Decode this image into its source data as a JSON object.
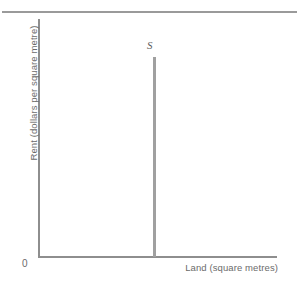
{
  "chart_data": {
    "type": "line",
    "title": "",
    "subtitle": "",
    "xlabel": "Land (square metres)",
    "ylabel": "Rent (dollars per square metre)",
    "origin_label": "0",
    "grid": false,
    "legend": "none",
    "axis_ranges": {
      "x": [
        0,
        1
      ],
      "y": [
        0,
        1
      ]
    },
    "axis_ticks": {
      "x": [],
      "y": []
    },
    "series": [
      {
        "name": "S",
        "description": "Perfectly inelastic supply of land — vertical line at a fixed quantity",
        "annotation": "S",
        "x": [
          0.49,
          0.49
        ],
        "y": [
          0.0,
          0.84
        ],
        "color": "#a0a0a0"
      }
    ],
    "annotations": [
      {
        "text": "S",
        "x": 0.49,
        "y": 0.88,
        "style": "italic"
      }
    ]
  },
  "figure": {
    "axis_color": "#8e8e8e",
    "curve_color": "#a0a0a0",
    "rule_color": "#9a9a9a",
    "text_color": "#6b6b6b",
    "background": "#ffffff"
  }
}
